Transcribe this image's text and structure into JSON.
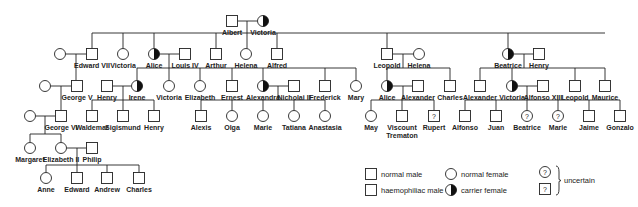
{
  "symbol_size": 11,
  "colors": {
    "line": "#222222",
    "affected": "#111111",
    "background": "#ffffff"
  },
  "people": [
    {
      "id": "albert",
      "name": "Albert",
      "sex": "M",
      "status": "normal",
      "x": 232,
      "y": 21
    },
    {
      "id": "victoria1",
      "name": "Victoria",
      "sex": "F",
      "status": "carrier",
      "x": 263,
      "y": 21
    },
    {
      "id": "g2_wife_edward",
      "name": "",
      "sex": "F",
      "status": "normal",
      "x": 60,
      "y": 54
    },
    {
      "id": "edward7",
      "name": "Edward VII",
      "sex": "M",
      "status": "normal",
      "x": 92,
      "y": 54
    },
    {
      "id": "victoria2",
      "name": "Victoria",
      "sex": "F",
      "status": "normal",
      "x": 123,
      "y": 54
    },
    {
      "id": "alice2",
      "name": "Alice",
      "sex": "F",
      "status": "carrier",
      "x": 154,
      "y": 54
    },
    {
      "id": "louis4",
      "name": "Louis IV",
      "sex": "M",
      "status": "normal",
      "x": 185,
      "y": 54
    },
    {
      "id": "arthur",
      "name": "Arthur",
      "sex": "M",
      "status": "normal",
      "x": 216,
      "y": 54
    },
    {
      "id": "helena2",
      "name": "Helena",
      "sex": "F",
      "status": "normal",
      "x": 246,
      "y": 54
    },
    {
      "id": "alfred",
      "name": "Alfred",
      "sex": "M",
      "status": "normal",
      "x": 277,
      "y": 54
    },
    {
      "id": "leopold2",
      "name": "Leopold",
      "sex": "M",
      "status": "affected",
      "x": 387,
      "y": 54
    },
    {
      "id": "helena_w",
      "name": "Helena",
      "sex": "F",
      "status": "normal",
      "x": 419,
      "y": 54
    },
    {
      "id": "beatrice2",
      "name": "Beatrice",
      "sex": "F",
      "status": "carrier",
      "x": 508,
      "y": 54
    },
    {
      "id": "henry2",
      "name": "Henry",
      "sex": "M",
      "status": "normal",
      "x": 539,
      "y": 54
    },
    {
      "id": "g3_wife_george",
      "name": "",
      "sex": "F",
      "status": "normal",
      "x": 45,
      "y": 86
    },
    {
      "id": "george5",
      "name": "George V",
      "sex": "M",
      "status": "normal",
      "x": 77,
      "y": 86
    },
    {
      "id": "henry3",
      "name": "Henry",
      "sex": "M",
      "status": "normal",
      "x": 107,
      "y": 86
    },
    {
      "id": "irene",
      "name": "Irene",
      "sex": "F",
      "status": "carrier",
      "x": 137,
      "y": 86
    },
    {
      "id": "victoria3",
      "name": "Victoria",
      "sex": "F",
      "status": "normal",
      "x": 169,
      "y": 86
    },
    {
      "id": "elizabeth3",
      "name": "Elizabeth",
      "sex": "F",
      "status": "normal",
      "x": 200,
      "y": 86
    },
    {
      "id": "ernest",
      "name": "Ernest",
      "sex": "M",
      "status": "normal",
      "x": 232,
      "y": 86
    },
    {
      "id": "alexandra",
      "name": "Alexandra",
      "sex": "F",
      "status": "carrier",
      "x": 263,
      "y": 86
    },
    {
      "id": "nicholai2",
      "name": "Nicholai II",
      "sex": "M",
      "status": "normal",
      "x": 294,
      "y": 86
    },
    {
      "id": "frederick",
      "name": "Frederick",
      "sex": "M",
      "status": "affected",
      "x": 325,
      "y": 86
    },
    {
      "id": "mary",
      "name": "Mary",
      "sex": "F",
      "status": "normal",
      "x": 356,
      "y": 86
    },
    {
      "id": "alice3",
      "name": "Alice",
      "sex": "F",
      "status": "carrier",
      "x": 387,
      "y": 86
    },
    {
      "id": "alexander3a",
      "name": "Alexander",
      "sex": "M",
      "status": "normal",
      "x": 418,
      "y": 86
    },
    {
      "id": "charles3",
      "name": "Charles",
      "sex": "M",
      "status": "normal",
      "x": 450,
      "y": 86
    },
    {
      "id": "alexander3b",
      "name": "Alexander",
      "sex": "M",
      "status": "normal",
      "x": 480,
      "y": 86
    },
    {
      "id": "victoria3b",
      "name": "Victoria",
      "sex": "F",
      "status": "carrier",
      "x": 512,
      "y": 86
    },
    {
      "id": "alfonso13",
      "name": "Alfonso XIII",
      "sex": "M",
      "status": "normal",
      "x": 543,
      "y": 86
    },
    {
      "id": "leopold3",
      "name": "Leopold",
      "sex": "M",
      "status": "affected",
      "x": 575,
      "y": 86
    },
    {
      "id": "maurice",
      "name": "Maurice",
      "sex": "M",
      "status": "affected",
      "x": 605,
      "y": 86
    },
    {
      "id": "g4_wife_george6",
      "name": "",
      "sex": "F",
      "status": "normal",
      "x": 30,
      "y": 116
    },
    {
      "id": "george6",
      "name": "George VI",
      "sex": "M",
      "status": "normal",
      "x": 61,
      "y": 116
    },
    {
      "id": "waldemar",
      "name": "Waldemar",
      "sex": "M",
      "status": "affected",
      "x": 92,
      "y": 116
    },
    {
      "id": "sigismund",
      "name": "Sigismund",
      "sex": "M",
      "status": "normal",
      "x": 123,
      "y": 116
    },
    {
      "id": "henry4",
      "name": "Henry",
      "sex": "M",
      "status": "affected",
      "x": 154,
      "y": 116
    },
    {
      "id": "alexis",
      "name": "Alexis",
      "sex": "M",
      "status": "affected",
      "x": 201,
      "y": 116
    },
    {
      "id": "olga",
      "name": "Olga",
      "sex": "F",
      "status": "normal",
      "x": 232,
      "y": 116
    },
    {
      "id": "marie4a",
      "name": "Marie",
      "sex": "F",
      "status": "normal",
      "x": 263,
      "y": 116
    },
    {
      "id": "tatiana",
      "name": "Tatiana",
      "sex": "F",
      "status": "normal",
      "x": 294,
      "y": 116
    },
    {
      "id": "anastasia",
      "name": "Anastasia",
      "sex": "F",
      "status": "normal",
      "x": 325,
      "y": 116
    },
    {
      "id": "may",
      "name": "May",
      "sex": "F",
      "status": "normal",
      "x": 371,
      "y": 116
    },
    {
      "id": "trematon",
      "name": "Viscount Trematon",
      "sex": "M",
      "status": "affected",
      "x": 402,
      "y": 116
    },
    {
      "id": "rupert",
      "name": "Rupert",
      "sex": "M",
      "status": "uncertain",
      "x": 434,
      "y": 116
    },
    {
      "id": "alfonso4",
      "name": "Alfonso",
      "sex": "M",
      "status": "affected",
      "x": 465,
      "y": 116
    },
    {
      "id": "juan",
      "name": "Juan",
      "sex": "M",
      "status": "normal",
      "x": 496,
      "y": 116
    },
    {
      "id": "beatrice4",
      "name": "Beatrice",
      "sex": "F",
      "status": "uncertain",
      "x": 527,
      "y": 116
    },
    {
      "id": "marie4b",
      "name": "Marie",
      "sex": "F",
      "status": "uncertain",
      "x": 558,
      "y": 116
    },
    {
      "id": "jaime",
      "name": "Jaime",
      "sex": "M",
      "status": "normal",
      "x": 589,
      "y": 116
    },
    {
      "id": "gonzalo",
      "name": "Gonzalo",
      "sex": "M",
      "status": "affected",
      "x": 620,
      "y": 116
    },
    {
      "id": "margaret",
      "name": "Margaret",
      "sex": "F",
      "status": "normal",
      "x": 30,
      "y": 148
    },
    {
      "id": "elizabeth2",
      "name": "Elizabeth II",
      "sex": "F",
      "status": "normal",
      "x": 61,
      "y": 148
    },
    {
      "id": "philip",
      "name": "Philip",
      "sex": "M",
      "status": "normal",
      "x": 92,
      "y": 148
    },
    {
      "id": "anne",
      "name": "Anne",
      "sex": "F",
      "status": "normal",
      "x": 46,
      "y": 178
    },
    {
      "id": "edward6",
      "name": "Edward",
      "sex": "M",
      "status": "normal",
      "x": 77,
      "y": 178
    },
    {
      "id": "andrew",
      "name": "Andrew",
      "sex": "M",
      "status": "normal",
      "x": 107,
      "y": 178
    },
    {
      "id": "charles6",
      "name": "Charles",
      "sex": "M",
      "status": "normal",
      "x": 139,
      "y": 178
    }
  ],
  "lines": [
    [
      237.5,
      21,
      257.5,
      21
    ],
    [
      247,
      21,
      247,
      33
    ],
    [
      92,
      33,
      605,
      33
    ],
    [
      92,
      33,
      92,
      48.5
    ],
    [
      123,
      33,
      123,
      48.5
    ],
    [
      154,
      33,
      154,
      48.5
    ],
    [
      216,
      33,
      216,
      48.5
    ],
    [
      247,
      33,
      247,
      48.5
    ],
    [
      277,
      33,
      277,
      48.5
    ],
    [
      387,
      33,
      387,
      48.5
    ],
    [
      508,
      33,
      508,
      48.5
    ],
    [
      65.5,
      54,
      86.5,
      54
    ],
    [
      76,
      54,
      76,
      80.5
    ],
    [
      159.5,
      54,
      179.5,
      54
    ],
    [
      169,
      54,
      169,
      68
    ],
    [
      137,
      68,
      356,
      68
    ],
    [
      137,
      68,
      137,
      80.5
    ],
    [
      169,
      68,
      169,
      80.5
    ],
    [
      200,
      68,
      200,
      68
    ],
    [
      200,
      68,
      200,
      80.5
    ],
    [
      232,
      68,
      232,
      80.5
    ],
    [
      263,
      68,
      263,
      80.5
    ],
    [
      325,
      68,
      325,
      80.5
    ],
    [
      356,
      68,
      356,
      80.5
    ],
    [
      392.5,
      54,
      413.5,
      54
    ],
    [
      403,
      54,
      403,
      68
    ],
    [
      387,
      68,
      450,
      68
    ],
    [
      387,
      68,
      387,
      80.5
    ],
    [
      450,
      68,
      450,
      80.5
    ],
    [
      513.5,
      54,
      533.5,
      54
    ],
    [
      524,
      54,
      524,
      68
    ],
    [
      480,
      68,
      605,
      68
    ],
    [
      480,
      68,
      480,
      80.5
    ],
    [
      512,
      68,
      512,
      80.5
    ],
    [
      575,
      68,
      575,
      80.5
    ],
    [
      605,
      68,
      605,
      80.5
    ],
    [
      50.5,
      86,
      71.5,
      86
    ],
    [
      61,
      86,
      61,
      110.5
    ],
    [
      112.5,
      86,
      131.5,
      86
    ],
    [
      123,
      86,
      123,
      100
    ],
    [
      92,
      100,
      154,
      100
    ],
    [
      92,
      100,
      92,
      110.5
    ],
    [
      123,
      100,
      123,
      110.5
    ],
    [
      154,
      100,
      154,
      110.5
    ],
    [
      268.5,
      86,
      288.5,
      86
    ],
    [
      278,
      86,
      278,
      100
    ],
    [
      201,
      100,
      325,
      100
    ],
    [
      201,
      100,
      201,
      110.5
    ],
    [
      232,
      100,
      232,
      110.5
    ],
    [
      263,
      100,
      263,
      110.5
    ],
    [
      294,
      100,
      294,
      110.5
    ],
    [
      325,
      100,
      325,
      110.5
    ],
    [
      392.5,
      86,
      412.5,
      86
    ],
    [
      403,
      86,
      403,
      100
    ],
    [
      371,
      100,
      434,
      100
    ],
    [
      371,
      100,
      371,
      110.5
    ],
    [
      402,
      100,
      402,
      110.5
    ],
    [
      434,
      100,
      434,
      110.5
    ],
    [
      517.5,
      86,
      537.5,
      86
    ],
    [
      527,
      86,
      527,
      100
    ],
    [
      465,
      100,
      620,
      100
    ],
    [
      465,
      100,
      465,
      110.5
    ],
    [
      496,
      100,
      496,
      110.5
    ],
    [
      527,
      100,
      527,
      110.5
    ],
    [
      558,
      100,
      558,
      110.5
    ],
    [
      589,
      100,
      589,
      110.5
    ],
    [
      620,
      100,
      620,
      110.5
    ],
    [
      35.5,
      116,
      55.5,
      116
    ],
    [
      45,
      116,
      45,
      134
    ],
    [
      30,
      134,
      61,
      134
    ],
    [
      30,
      134,
      30,
      142.5
    ],
    [
      61,
      134,
      61,
      142.5
    ],
    [
      66.5,
      148,
      86.5,
      148
    ],
    [
      77,
      148,
      77,
      165
    ],
    [
      46,
      165,
      139,
      165
    ],
    [
      46,
      165,
      46,
      172.5
    ],
    [
      77,
      165,
      77,
      172.5
    ],
    [
      107,
      165,
      107,
      172.5
    ],
    [
      139,
      165,
      139,
      172.5
    ]
  ],
  "legend": {
    "items": [
      {
        "symbol": "square",
        "status": "normal",
        "label": "normal male",
        "x": 371,
        "y": 174
      },
      {
        "symbol": "square",
        "status": "affected",
        "label": "haemophiliac male",
        "x": 371,
        "y": 190
      },
      {
        "symbol": "circle",
        "status": "normal",
        "label": "normal female",
        "x": 451,
        "y": 174
      },
      {
        "symbol": "circle",
        "status": "carrier",
        "label": "carrier female",
        "x": 451,
        "y": 190
      }
    ],
    "uncertain": {
      "label": "uncertain",
      "circle_x": 545,
      "circle_y": 172,
      "square_x": 545,
      "square_y": 189,
      "question_mark": "?"
    }
  }
}
